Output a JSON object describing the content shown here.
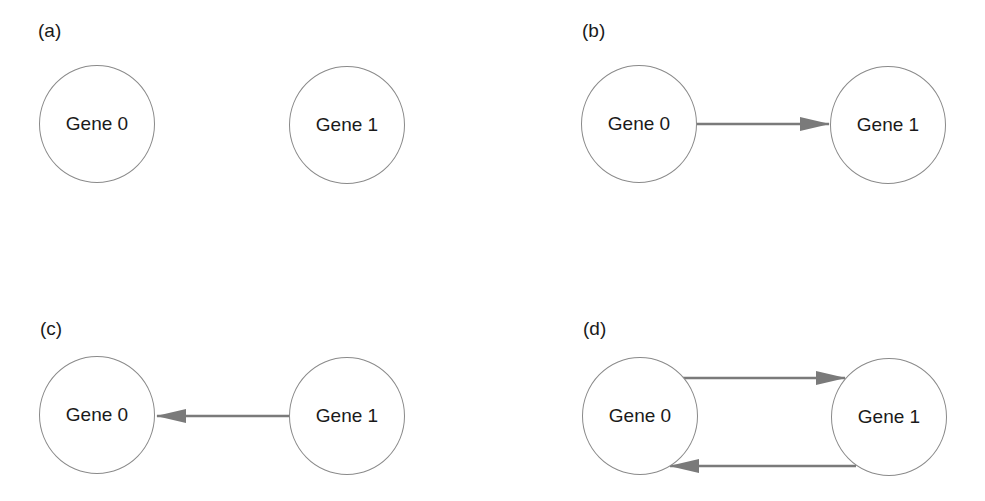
{
  "panels": [
    {
      "label": "(a)",
      "nodes": [
        "Gene 0",
        "Gene 1"
      ],
      "edges": []
    },
    {
      "label": "(b)",
      "nodes": [
        "Gene 0",
        "Gene 1"
      ],
      "edges": [
        {
          "from": "Gene 0",
          "to": "Gene 1"
        }
      ]
    },
    {
      "label": "(c)",
      "nodes": [
        "Gene 0",
        "Gene 1"
      ],
      "edges": [
        {
          "from": "Gene 1",
          "to": "Gene 0"
        }
      ]
    },
    {
      "label": "(d)",
      "nodes": [
        "Gene 0",
        "Gene 1"
      ],
      "edges": [
        {
          "from": "Gene 0",
          "to": "Gene 1"
        },
        {
          "from": "Gene 1",
          "to": "Gene 0"
        }
      ]
    }
  ],
  "colors": {
    "edge": "#7a7a7a",
    "node_border": "#8a8a8a",
    "text": "#1a1a1a"
  }
}
